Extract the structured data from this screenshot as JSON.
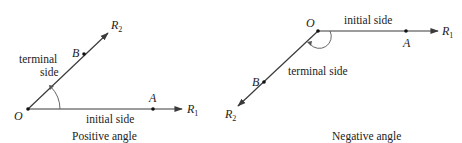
{
  "diagram": {
    "colors": {
      "ray": "#3a3a3a",
      "text": "#222222",
      "background": "#ffffff"
    },
    "positive": {
      "caption": "Positive angle",
      "vertex": "O",
      "point_initial": "A",
      "point_terminal": "B",
      "ray_initial": "R",
      "ray_initial_sub": "1",
      "ray_terminal": "R",
      "ray_terminal_sub": "2",
      "initial_label": "initial side",
      "terminal_label_line1": "terminal",
      "terminal_label_line2": "side"
    },
    "negative": {
      "caption": "Negative angle",
      "vertex": "O",
      "point_initial": "A",
      "point_terminal": "B",
      "ray_initial": "R",
      "ray_initial_sub": "1",
      "ray_terminal": "R",
      "ray_terminal_sub": "2",
      "initial_label": "initial side",
      "terminal_label": "terminal side"
    }
  }
}
